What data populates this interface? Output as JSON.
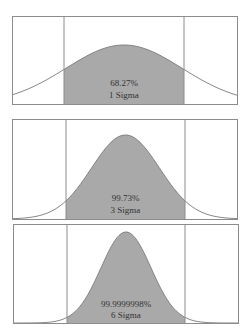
{
  "colors": {
    "fill": "#a9a9a9",
    "stroke": "#7a7a7a",
    "frame": "#8c8c8c",
    "text": "#333333",
    "background": "#ffffff"
  },
  "chart_data": [
    {
      "type": "area",
      "title": "",
      "description": "Normal distribution with shaded region between vertical boundary lines",
      "percentage_label": "68.27%",
      "sigma_label": "1 Sigma",
      "coverage_percent": 68.27,
      "sigma_level": 1,
      "frame": {
        "x": 12,
        "y": 16,
        "w": 225,
        "h": 88
      },
      "bounds_x": [
        64,
        184
      ],
      "peak_y": 45,
      "sd_px": 58,
      "label_y": [
        86,
        98
      ]
    },
    {
      "type": "area",
      "title": "",
      "description": "Normal distribution with shaded region between vertical boundary lines",
      "percentage_label": "99.73%",
      "sigma_label": "3 Sigma",
      "coverage_percent": 99.73,
      "sigma_level": 3,
      "frame": {
        "x": 12,
        "y": 119,
        "w": 225,
        "h": 100
      },
      "bounds_x": [
        66,
        185
      ],
      "peak_y": 135,
      "sd_px": 34,
      "label_y": [
        201,
        213
      ]
    },
    {
      "type": "area",
      "title": "",
      "description": "Normal distribution with shaded region between vertical boundary lines",
      "percentage_label": "99.9999998%",
      "sigma_label": "6 Sigma",
      "coverage_percent": 99.9999998,
      "sigma_level": 6,
      "frame": {
        "x": 13,
        "y": 224,
        "w": 225,
        "h": 99
      },
      "bounds_x": [
        67,
        185
      ],
      "peak_y": 232,
      "sd_px": 25,
      "label_y": [
        307,
        318
      ]
    }
  ]
}
